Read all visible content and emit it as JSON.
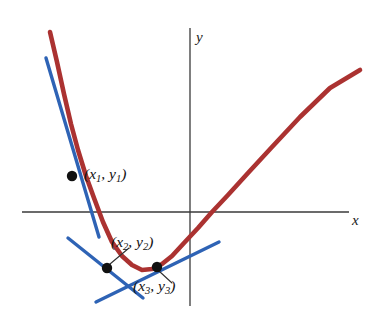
{
  "figure": {
    "name": "tangent-lines-to-parabola",
    "background": "#ffffff",
    "width": 383,
    "height": 321
  },
  "axes": {
    "x_label": "x",
    "y_label": "y",
    "axis_color": "#3a3a3a",
    "x_axis": {
      "y_px": 212,
      "x_start_px": 22,
      "x_end_px": 349
    },
    "y_axis": {
      "x_px": 190,
      "y_start_px": 28,
      "y_end_px": 306
    }
  },
  "colors": {
    "curve_red": "#ab3231",
    "tangent_blue": "#2e63b5",
    "point_black": "#111111",
    "axis_gray": "#3a3a3a",
    "leader_gray": "#303030"
  },
  "labels": {
    "point1": {
      "prefix": "(x",
      "sub1": "1",
      "mid": ", y",
      "sub2": "1",
      "suffix": ")"
    },
    "point2": {
      "prefix": "(x",
      "sub1": "2",
      "mid": ", y",
      "sub2": "2",
      "suffix": ")"
    },
    "point3": {
      "prefix": "(x",
      "sub1": "3",
      "mid": ", y",
      "sub2": "3",
      "suffix": ")"
    }
  },
  "chart_data": {
    "type": "line",
    "title": "",
    "xlabel": "x",
    "ylabel": "y",
    "grid": false,
    "legend": null,
    "series": [
      {
        "name": "curve",
        "role": "parabola",
        "color": "#ab3231",
        "stroke_width": 4.6,
        "points_px": [
          [
            50,
            32
          ],
          [
            57,
            62
          ],
          [
            64,
            94
          ],
          [
            71,
            124
          ],
          [
            78,
            150
          ],
          [
            86,
            176
          ],
          [
            94,
            198
          ],
          [
            103,
            222
          ],
          [
            112,
            242
          ],
          [
            122,
            256
          ],
          [
            132,
            265
          ],
          [
            142,
            270
          ],
          [
            152,
            269
          ],
          [
            162,
            264
          ],
          [
            172,
            256
          ],
          [
            184,
            243
          ],
          [
            198,
            228
          ],
          [
            212,
            212
          ],
          [
            228,
            195
          ],
          [
            248,
            173
          ],
          [
            272,
            147
          ],
          [
            300,
            117
          ],
          [
            330,
            88
          ],
          [
            360,
            70
          ]
        ]
      },
      {
        "name": "tangent-at-point-1",
        "role": "tangent",
        "color": "#2e63b5",
        "stroke_width": 3.4,
        "through_point": "point1",
        "endpoints_px": [
          [
            46,
            58
          ],
          [
            99,
            237
          ]
        ]
      },
      {
        "name": "tangent-at-point-2",
        "role": "tangent",
        "color": "#2e63b5",
        "stroke_width": 3.4,
        "through_point": "point2",
        "endpoints_px": [
          [
            68,
            238
          ],
          [
            143,
            298
          ]
        ]
      },
      {
        "name": "tangent-at-point-3",
        "role": "tangent",
        "color": "#2e63b5",
        "stroke_width": 3.4,
        "through_point": "point3",
        "endpoints_px": [
          [
            96,
            302
          ],
          [
            219,
            242
          ]
        ]
      }
    ],
    "points": [
      {
        "name": "point1",
        "label": "(x1, y1)",
        "px": [
          72,
          176
        ],
        "radius_px": 5.2
      },
      {
        "name": "point2",
        "label": "(x2, y2)",
        "px": [
          107,
          268
        ],
        "radius_px": 5.2
      },
      {
        "name": "point3",
        "label": "(x3, y3)",
        "px": [
          157,
          267
        ],
        "radius_px": 5.2
      }
    ],
    "leaders": [
      {
        "name": "leader-point-2",
        "from_px": [
          110,
          264
        ],
        "to_px": [
          129,
          248
        ]
      },
      {
        "name": "leader-point-3",
        "from_px": [
          159,
          271
        ],
        "to_px": [
          172,
          283
        ]
      }
    ]
  }
}
